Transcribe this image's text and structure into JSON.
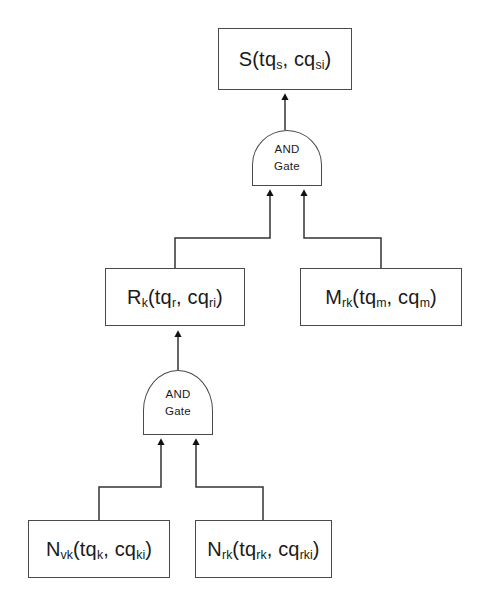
{
  "diagram": {
    "stroke_color": "#4a4a4a",
    "background_color": "#ffffff",
    "text_color": "#1a1a1a",
    "nodes": {
      "top_event": {
        "id": "S",
        "base": "S(tq",
        "sub1": "s",
        "mid": ", cq",
        "sub2": "si",
        "close": ")",
        "plain": "S(tq_s, cq_si)"
      },
      "r_event": {
        "id": "R",
        "base": "R",
        "sub0": "k",
        "open": "(tq",
        "sub1": "r",
        "mid": ", cq",
        "sub2": "ri",
        "close": ")",
        "plain": "R_k(tq_r, cq_ri)"
      },
      "m_event": {
        "id": "M",
        "base": "M",
        "sub0": "rk",
        "open": "(tq",
        "sub1": "m",
        "mid": ", cq",
        "sub2": "m",
        "close": ")",
        "plain": "M_rk(tq_m, cq_m)"
      },
      "nvk_event": {
        "id": "Nvk",
        "base": "N",
        "sub0": "vk",
        "open": "(tq",
        "sub1": "k",
        "mid": ", cq",
        "sub2": "ki",
        "close": ")",
        "plain": "N_vk(tq_k, cq_ki)"
      },
      "nrk_event": {
        "id": "Nrk",
        "base": "N",
        "sub0": "rk",
        "open": "(tq",
        "sub1": "rk",
        "mid": ", cq",
        "sub2": "rki",
        "close": ")",
        "plain": "N_rk(tq_rk, cq_rki)"
      }
    },
    "gates": {
      "top_gate": {
        "line1": "AND",
        "line2": "Gate",
        "type": "AND"
      },
      "lower_gate": {
        "line1": "AND",
        "line2": "Gate",
        "type": "AND"
      }
    }
  }
}
